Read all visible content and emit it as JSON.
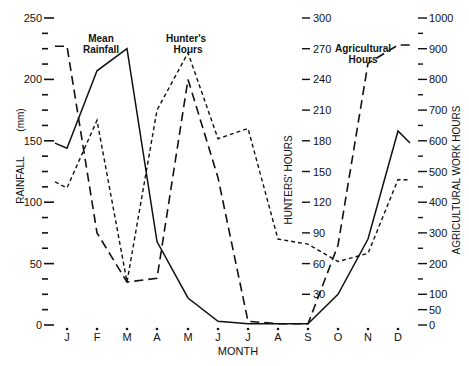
{
  "chart_data": {
    "type": "line",
    "title": "",
    "xlabel": "MONTH",
    "categories": [
      "J",
      "F",
      "M",
      "A",
      "M",
      "J",
      "J",
      "A",
      "S",
      "O",
      "N",
      "D"
    ],
    "axes": {
      "left": {
        "label": "RAINFALL  (mm)",
        "ylim": [
          0,
          250
        ],
        "ticks": [
          0,
          50,
          100,
          150,
          200,
          250
        ]
      },
      "right_inner": {
        "label": "HUNTERS' HOURS",
        "ylim": [
          0,
          300
        ],
        "ticks": [
          30,
          60,
          90,
          120,
          150,
          180,
          210,
          240,
          270,
          300
        ]
      },
      "right_outer": {
        "label": "AGRICULTURAL WORK HOURS",
        "ylim": [
          0,
          1000
        ],
        "ticks": [
          0,
          50,
          100,
          200,
          300,
          400,
          500,
          600,
          700,
          800,
          900,
          1000
        ]
      }
    },
    "series": [
      {
        "name": "Mean Rainfall",
        "axis": "left",
        "style": "solid",
        "unit": "mm",
        "values": [
          144,
          207,
          225,
          68,
          22,
          3,
          1,
          1,
          1,
          25,
          70,
          158
        ]
      },
      {
        "name": "Hunter's Hours",
        "axis": "right_inner",
        "style": "short-dash",
        "unit": "hours",
        "values": [
          134,
          200,
          42,
          210,
          266,
          182,
          192,
          84,
          79,
          62,
          70,
          142
        ]
      },
      {
        "name": "Agricultural Hours",
        "axis": "right_outer",
        "style": "long-dash",
        "unit": "hours",
        "values": [
          908,
          300,
          140,
          152,
          800,
          480,
          12,
          4,
          4,
          260,
          852,
          912
        ]
      }
    ],
    "annotations": [
      "Mean Rainfall",
      "Hunter's Hours",
      "Agricultural Hours"
    ],
    "grid": false,
    "legend": "inline labels"
  },
  "labels": {
    "mean_rainfall_1": "Mean",
    "mean_rainfall_2": "Rainfall",
    "hunters_1": "Hunter's",
    "hunters_2": "Hours",
    "agri_1": "Agricultural",
    "agri_2": "Hours",
    "month": "MONTH",
    "rainfall_axis": "RAINFALL",
    "rainfall_unit": "(mm)",
    "hunters_axis": "HUNTERS'  HOURS",
    "agri_axis": "AGRICULTURAL  WORK  HOURS"
  }
}
